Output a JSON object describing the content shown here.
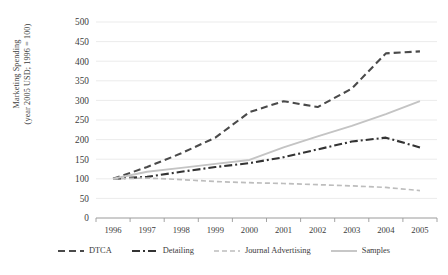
{
  "chart_data": {
    "type": "line",
    "title": "",
    "xlabel": "",
    "ylabel": "Marketing Spending (year 2005 USD; 1996 = 100)",
    "ylabel_line1": "Marketing Spending",
    "ylabel_line2": "(year 2005 USD; 1996 = 100)",
    "categories": [
      "1996",
      "1997",
      "1998",
      "1999",
      "2000",
      "2001",
      "2002",
      "2003",
      "2004",
      "2005"
    ],
    "x": [
      1996,
      1997,
      1998,
      1999,
      2000,
      2001,
      2002,
      2003,
      2004,
      2005
    ],
    "ylim": [
      0,
      500
    ],
    "yticks": [
      0,
      50,
      100,
      150,
      200,
      250,
      300,
      350,
      400,
      450,
      500
    ],
    "ytick_labels": [
      "0",
      "50",
      "100",
      "150",
      "200",
      "250",
      "300",
      "350",
      "400",
      "450",
      "500"
    ],
    "grid": true,
    "grid_axis": "y",
    "legend_position": "bottom",
    "series": [
      {
        "name": "DTCA",
        "values": [
          100,
          130,
          165,
          205,
          270,
          298,
          283,
          330,
          420,
          425
        ],
        "color": "#4a4a4a",
        "dash": "7,4",
        "width": 2.1
      },
      {
        "name": "Detailing",
        "values": [
          100,
          105,
          118,
          130,
          140,
          155,
          175,
          195,
          205,
          180
        ],
        "color": "#333333",
        "dash": "8,3,2,3",
        "width": 2.1
      },
      {
        "name": "Journal Advertising",
        "values": [
          100,
          102,
          98,
          93,
          90,
          88,
          85,
          82,
          78,
          70
        ],
        "color": "#bdbdbd",
        "dash": "5,3",
        "width": 1.7
      },
      {
        "name": "Samples",
        "values": [
          100,
          118,
          128,
          138,
          148,
          180,
          208,
          235,
          265,
          298
        ],
        "color": "#c4c4c4",
        "dash": "none",
        "width": 1.9
      }
    ]
  },
  "legend": {
    "items": [
      {
        "label": "DTCA"
      },
      {
        "label": "Detailing"
      },
      {
        "label": "Journal Advertising"
      },
      {
        "label": "Samples"
      }
    ]
  }
}
